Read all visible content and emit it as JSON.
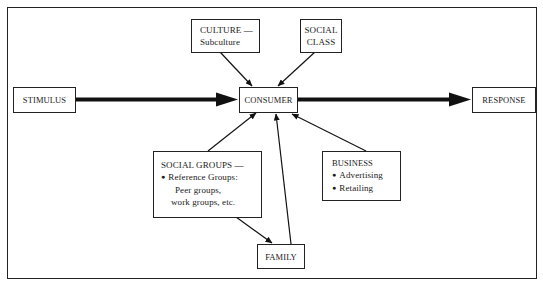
{
  "diagram": {
    "type": "consumer behavior influence model",
    "nodes": {
      "stimulus": {
        "label": "STIMULUS"
      },
      "consumer": {
        "label": "CONSUMER"
      },
      "response": {
        "label": "RESPONSE"
      },
      "culture": {
        "line1": "CULTURE —",
        "line2": "Subculture"
      },
      "social_class": {
        "line1": "SOCIAL",
        "line2": "CLASS"
      },
      "social_groups": {
        "title": "SOCIAL GROUPS —",
        "bullet1": "Reference Groups:",
        "sub1": "Peer groups,",
        "sub2": "work groups, etc."
      },
      "business": {
        "title": "BUSINESS",
        "bullet1": "Advertising",
        "bullet2": "Retailing"
      },
      "family": {
        "label": "FAMILY"
      }
    },
    "edges": [
      {
        "from": "STIMULUS",
        "to": "CONSUMER",
        "weight": "heavy"
      },
      {
        "from": "CONSUMER",
        "to": "RESPONSE",
        "weight": "heavy"
      },
      {
        "from": "CULTURE — Subculture",
        "to": "CONSUMER",
        "weight": "thin"
      },
      {
        "from": "SOCIAL CLASS",
        "to": "CONSUMER",
        "weight": "thin"
      },
      {
        "from": "SOCIAL GROUPS",
        "to": "CONSUMER",
        "weight": "thin"
      },
      {
        "from": "SOCIAL GROUPS",
        "to": "FAMILY",
        "weight": "thin"
      },
      {
        "from": "FAMILY",
        "to": "CONSUMER",
        "weight": "thin"
      },
      {
        "from": "BUSINESS",
        "to": "CONSUMER",
        "weight": "thin"
      }
    ]
  }
}
